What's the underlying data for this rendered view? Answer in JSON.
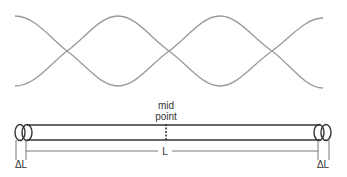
{
  "wave": {
    "description": "standing wave envelope",
    "antinodes": 3,
    "nodes": 3,
    "color": "#9a9a9a"
  },
  "tube": {
    "midpoint_label_line1": "mid",
    "midpoint_label_line2": "point",
    "length_label": "L",
    "end_correction_left": "ΔL",
    "end_correction_right": "ΔL",
    "color": "#333333"
  }
}
